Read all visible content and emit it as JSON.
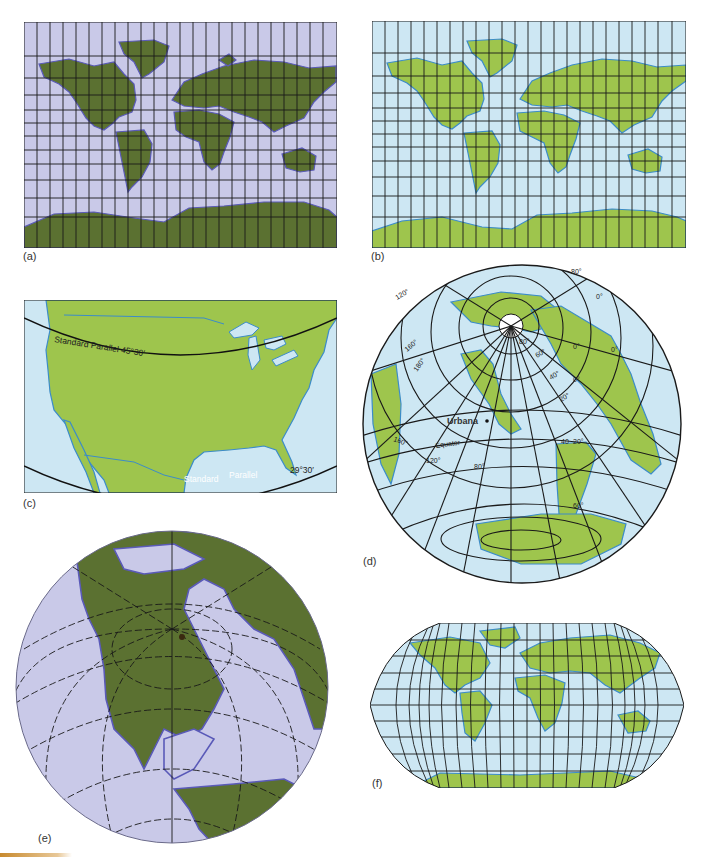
{
  "figure": {
    "colors": {
      "lavender_ocean": "#c9c9e8",
      "dark_land": "#5b7131",
      "purple_coast": "#5a5ab8",
      "light_blue_ocean": "#cde7f3",
      "light_land": "#9ec54d",
      "blue_coast": "#3c8cc8",
      "grid": "#1a1a1a",
      "accent_bar": "#c88a2e"
    },
    "panels": [
      {
        "id": "a",
        "label": "(a)",
        "type": "cylindrical-world-map",
        "style": "dark"
      },
      {
        "id": "b",
        "label": "(b)",
        "type": "cylindrical-world-map",
        "style": "light"
      },
      {
        "id": "c",
        "label": "(c)",
        "type": "conic-united-states",
        "annotations": {
          "parallel_north": "Standard Parallel 45°30′",
          "parallel_south_a": "Standard",
          "parallel_south_b": "Parallel",
          "parallel_south_deg": "29°30′"
        }
      },
      {
        "id": "d",
        "label": "(d)",
        "type": "oblique-azimuthal",
        "annotations": {
          "city": "Urbana",
          "equator": "Equator",
          "lon_labels": [
            "120°",
            "160°",
            "180°",
            "160°",
            "120°",
            "80°",
            "80°",
            "0°",
            "0°",
            "0°",
            "0°"
          ],
          "lat_labels": [
            "60°",
            "40°",
            "20°",
            "40",
            "20°",
            "60°",
            "80°",
            "80°"
          ]
        }
      },
      {
        "id": "e",
        "label": "(e)",
        "type": "orthographic-globe",
        "style": "dark"
      },
      {
        "id": "f",
        "label": "(f)",
        "type": "robinson-world-map",
        "style": "light"
      }
    ]
  }
}
